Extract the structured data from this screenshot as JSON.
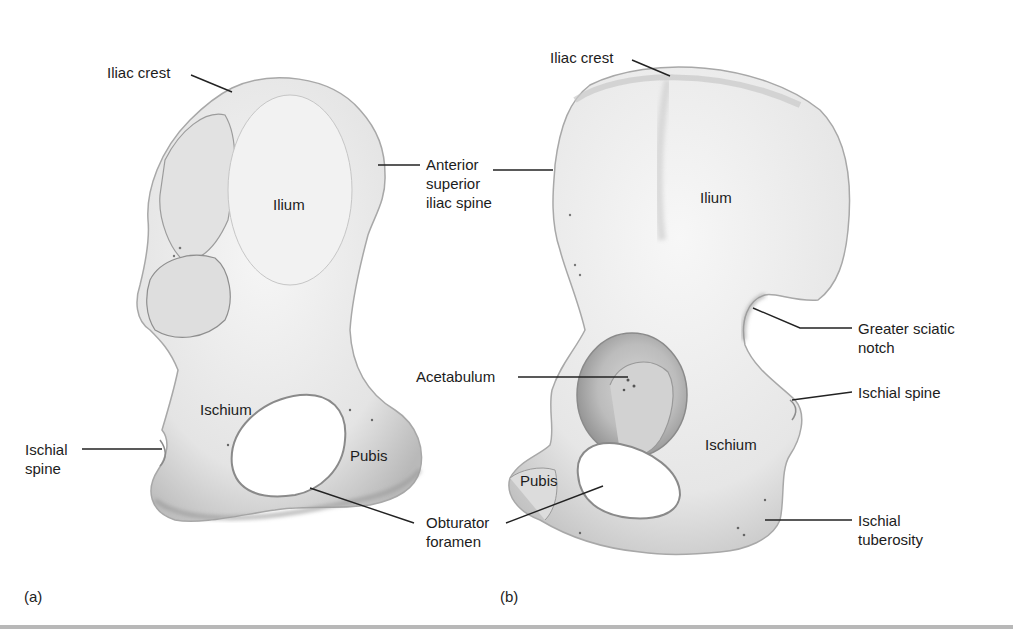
{
  "figure": {
    "panels": [
      {
        "tag": "(a)",
        "labels": {
          "iliac_crest": "Iliac crest",
          "asis": "Anterior\nsuperior\niliac spine",
          "ilium": "Ilium",
          "ischium": "Ischium",
          "ischial_spine": "Ischial\nspine",
          "pubis": "Pubis",
          "obturator_foramen": "Obturator\nforamen"
        }
      },
      {
        "tag": "(b)",
        "labels": {
          "iliac_crest": "Iliac crest",
          "ilium": "Ilium",
          "greater_sciatic_notch": "Greater sciatic\nnotch",
          "acetabulum": "Acetabulum",
          "ischial_spine": "Ischial spine",
          "ischium": "Ischium",
          "pubis": "Pubis",
          "ischial_tuberosity": "Ischial\ntuberosity"
        }
      }
    ],
    "colors": {
      "bone_fill": "#ececec",
      "bone_shadow": "#9a9a9a",
      "leader_line": "#222222",
      "rule": "#b8b8b8"
    }
  }
}
